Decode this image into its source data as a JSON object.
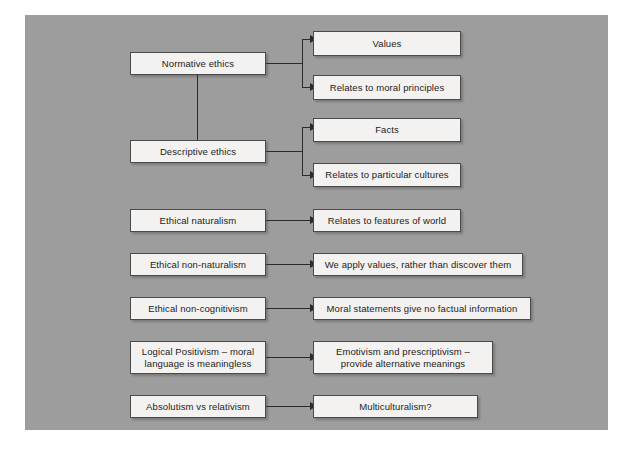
{
  "diagram": {
    "background_color": "#9d9d9d",
    "page_color": "#ffffff",
    "node_fill": "#f3f2f0",
    "node_border": "#4a4a4a",
    "connector_color": "#2b2b2b",
    "nodes": [
      {
        "id": "normative-ethics",
        "label": "Normative ethics"
      },
      {
        "id": "values",
        "label": "Values"
      },
      {
        "id": "relates-moral-principles",
        "label": "Relates to moral principles"
      },
      {
        "id": "descriptive-ethics",
        "label": "Descriptive ethics"
      },
      {
        "id": "facts",
        "label": "Facts"
      },
      {
        "id": "relates-particular-cultures",
        "label": "Relates to particular cultures"
      },
      {
        "id": "ethical-naturalism",
        "label": "Ethical naturalism"
      },
      {
        "id": "relates-features-world",
        "label": "Relates to features of world"
      },
      {
        "id": "ethical-non-naturalism",
        "label": "Ethical non-naturalism"
      },
      {
        "id": "we-apply-values",
        "label": "We apply values, rather than discover them"
      },
      {
        "id": "ethical-non-cognitivism",
        "label": "Ethical non-cognitivism"
      },
      {
        "id": "moral-statements",
        "label": "Moral statements give no factual information"
      },
      {
        "id": "logical-positivism",
        "label": "Logical Positivism – moral",
        "label_line2": "language is meaningless"
      },
      {
        "id": "emotivism",
        "label": "Emotivism and prescriptivism –",
        "label_line2": "provide alternative meanings"
      },
      {
        "id": "absolutism-relativism",
        "label": "Absolutism vs relativism"
      },
      {
        "id": "multiculturalism",
        "label": "Multiculturalism?"
      }
    ]
  }
}
